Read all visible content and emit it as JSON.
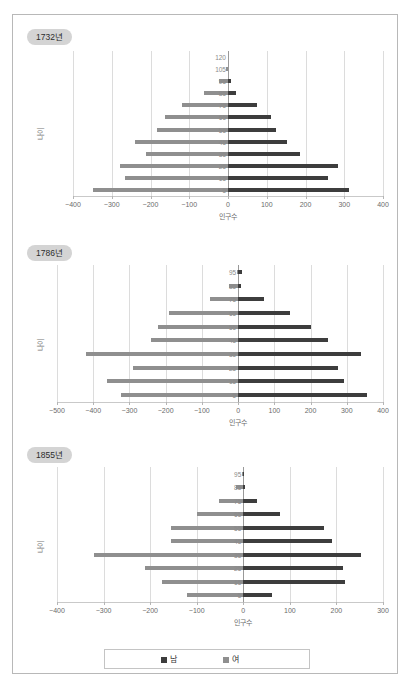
{
  "page": {
    "title": "",
    "legend_male_label": "남",
    "legend_female_label": "여",
    "male_color": "#3d3d3d",
    "female_color": "#8f8f8f",
    "axis_y_label": "나이",
    "axis_x_label": "인구수"
  },
  "chart_data": [
    {
      "type": "bar",
      "title": "1732년",
      "xlabel": "인구수",
      "ylabel": "나이",
      "xlim": [
        -400,
        400
      ],
      "xticks": [
        -400,
        -300,
        -200,
        -100,
        0,
        100,
        200,
        300,
        400
      ],
      "categories": [
        5,
        15,
        25,
        35,
        45,
        55,
        65,
        75,
        85,
        95,
        105,
        120
      ],
      "legend_position": "bottom",
      "grid": true,
      "series": [
        {
          "name": "남",
          "values": [
            313,
            259,
            285,
            185,
            153,
            123,
            110,
            75,
            20,
            8,
            0,
            0
          ]
        },
        {
          "name": "여",
          "values": [
            -348,
            -265,
            -278,
            -212,
            -240,
            -184,
            -163,
            -118,
            -62,
            -22,
            -5,
            0
          ]
        }
      ]
    },
    {
      "type": "bar",
      "title": "1786년",
      "xlabel": "인구수",
      "ylabel": "나이",
      "xlim": [
        -500,
        400
      ],
      "xticks": [
        -500,
        -400,
        -300,
        -200,
        -100,
        0,
        100,
        200,
        300,
        400
      ],
      "categories": [
        5,
        15,
        25,
        35,
        45,
        55,
        65,
        75,
        85,
        95
      ],
      "legend_position": "bottom",
      "grid": true,
      "series": [
        {
          "name": "남",
          "values": [
            355,
            292,
            275,
            338,
            248,
            200,
            143,
            72,
            8,
            11
          ]
        },
        {
          "name": "여",
          "values": [
            -322,
            -362,
            -290,
            -420,
            -240,
            -222,
            -192,
            -77,
            -26,
            -4
          ]
        }
      ]
    },
    {
      "type": "bar",
      "title": "1855년",
      "xlabel": "인구수",
      "ylabel": "나이",
      "xlim": [
        -400,
        300
      ],
      "xticks": [
        -400,
        -300,
        -200,
        -100,
        0,
        100,
        200,
        300
      ],
      "categories": [
        5,
        15,
        25,
        35,
        45,
        55,
        65,
        75,
        85,
        95
      ],
      "legend_position": "bottom",
      "grid": true,
      "series": [
        {
          "name": "남",
          "values": [
            62,
            218,
            214,
            252,
            190,
            173,
            78,
            30,
            4,
            2
          ]
        },
        {
          "name": "여",
          "values": [
            -120,
            -175,
            -210,
            -320,
            -155,
            -155,
            -100,
            -53,
            -15,
            -3
          ]
        }
      ]
    }
  ]
}
